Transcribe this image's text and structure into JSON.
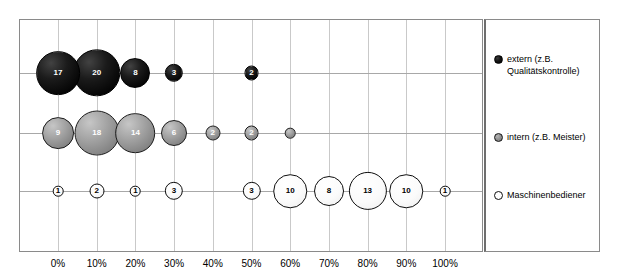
{
  "chart_data": {
    "type": "scatter",
    "title": "",
    "xlabel": "",
    "ylabel": "",
    "xlim": [
      0,
      100
    ],
    "grid": true,
    "legend_position": "right",
    "x_tick_labels": [
      "0%",
      "10%",
      "20%",
      "30%",
      "40%",
      "50%",
      "60%",
      "70%",
      "80%",
      "90%",
      "100%"
    ],
    "x_tick_values": [
      0,
      10,
      20,
      30,
      40,
      50,
      60,
      70,
      80,
      90,
      100
    ],
    "categories": [
      "extern (z.B. Qualitätskontrolle)",
      "intern (z.B. Meister)",
      "Maschinenbediener"
    ],
    "series": [
      {
        "name": "extern (z.B. Qualitätskontrolle)",
        "short_name": "extern",
        "color": "#000000",
        "row": 0,
        "points": [
          {
            "x": 0,
            "size": 17,
            "label": "17"
          },
          {
            "x": 10,
            "size": 20,
            "label": "20"
          },
          {
            "x": 20,
            "size": 8,
            "label": "8"
          },
          {
            "x": 30,
            "size": 3,
            "label": "3"
          },
          {
            "x": 50,
            "size": 2,
            "label": "2"
          }
        ]
      },
      {
        "name": "intern (z.B. Meister)",
        "short_name": "intern",
        "color": "#8d8d8d",
        "row": 1,
        "points": [
          {
            "x": 0,
            "size": 9,
            "label": "9"
          },
          {
            "x": 10,
            "size": 18,
            "label": "18"
          },
          {
            "x": 20,
            "size": 14,
            "label": "14"
          },
          {
            "x": 30,
            "size": 6,
            "label": "6"
          },
          {
            "x": 40,
            "size": 2,
            "label": "2"
          },
          {
            "x": 50,
            "size": 2,
            "label": "2"
          },
          {
            "x": 60,
            "size": 1,
            "label": ""
          }
        ]
      },
      {
        "name": "Maschinenbediener",
        "short_name": "Maschinenbediener",
        "color": "#ffffff",
        "row": 2,
        "points": [
          {
            "x": 0,
            "size": 1,
            "label": "1"
          },
          {
            "x": 10,
            "size": 2,
            "label": "2"
          },
          {
            "x": 20,
            "size": 1,
            "label": "1"
          },
          {
            "x": 30,
            "size": 3,
            "label": "3"
          },
          {
            "x": 50,
            "size": 3,
            "label": "3"
          },
          {
            "x": 60,
            "size": 10,
            "label": "10"
          },
          {
            "x": 70,
            "size": 8,
            "label": "8"
          },
          {
            "x": 80,
            "size": 13,
            "label": "13"
          },
          {
            "x": 90,
            "size": 10,
            "label": "10"
          },
          {
            "x": 100,
            "size": 1,
            "label": "1"
          }
        ]
      }
    ]
  },
  "legend": {
    "items": [
      {
        "label": "extern (z.B. Qualitätskontrolle)",
        "swatch": "extern-bubble-icon"
      },
      {
        "label": "intern (z.B. Meister)",
        "swatch": "intern-bubble-icon"
      },
      {
        "label": "Maschinenbediener",
        "swatch": "maschinenbediener-bubble-icon"
      }
    ]
  }
}
